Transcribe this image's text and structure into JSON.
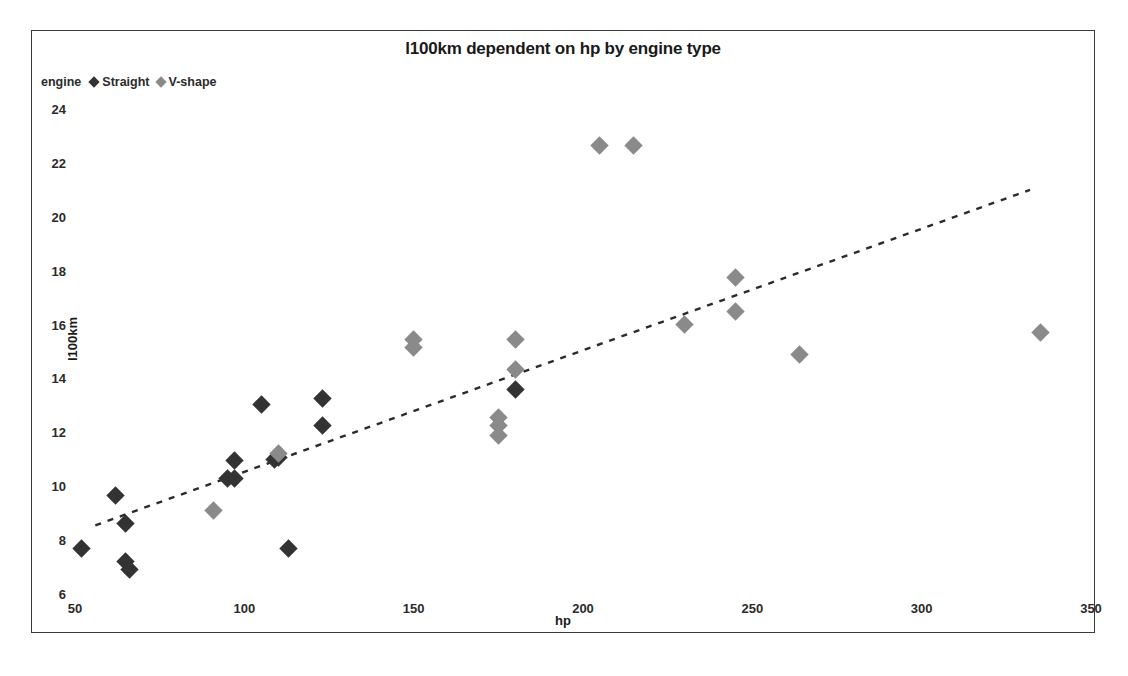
{
  "chart_data": {
    "type": "scatter",
    "title": "l100km dependent on hp by engine type",
    "xlabel": "hp",
    "ylabel": "l100km",
    "xlim": [
      50,
      350
    ],
    "ylim": [
      6,
      24
    ],
    "xticks": [
      50,
      100,
      150,
      200,
      250,
      300,
      350
    ],
    "yticks": [
      6,
      8,
      10,
      12,
      14,
      16,
      18,
      20,
      22,
      24
    ],
    "grid": false,
    "legend": {
      "title": "engine",
      "position": "top-left",
      "entries": [
        {
          "name": "Straight",
          "marker": "diamond",
          "color": "#333333"
        },
        {
          "name": "V-shape",
          "marker": "diamond",
          "color": "#8a8a8a"
        }
      ]
    },
    "series": [
      {
        "name": "Straight",
        "color": "#333333",
        "marker": "diamond",
        "points": [
          {
            "x": 52,
            "y": 7.7
          },
          {
            "x": 62,
            "y": 9.65
          },
          {
            "x": 65,
            "y": 8.6
          },
          {
            "x": 65,
            "y": 7.2
          },
          {
            "x": 66,
            "y": 6.9
          },
          {
            "x": 95,
            "y": 10.3
          },
          {
            "x": 97,
            "y": 10.3
          },
          {
            "x": 97,
            "y": 10.95
          },
          {
            "x": 105,
            "y": 13.05
          },
          {
            "x": 109,
            "y": 11.0
          },
          {
            "x": 110,
            "y": 11.05
          },
          {
            "x": 113,
            "y": 7.7
          },
          {
            "x": 123,
            "y": 13.25
          },
          {
            "x": 123,
            "y": 12.25
          },
          {
            "x": 180,
            "y": 13.6
          }
        ]
      },
      {
        "name": "V-shape",
        "color": "#8a8a8a",
        "marker": "diamond",
        "points": [
          {
            "x": 91,
            "y": 9.1
          },
          {
            "x": 110,
            "y": 11.2
          },
          {
            "x": 150,
            "y": 15.45
          },
          {
            "x": 150,
            "y": 15.15
          },
          {
            "x": 175,
            "y": 12.55
          },
          {
            "x": 175,
            "y": 12.25
          },
          {
            "x": 175,
            "y": 11.9
          },
          {
            "x": 180,
            "y": 15.45
          },
          {
            "x": 180,
            "y": 14.35
          },
          {
            "x": 205,
            "y": 22.65
          },
          {
            "x": 215,
            "y": 22.65
          },
          {
            "x": 230,
            "y": 16.0
          },
          {
            "x": 245,
            "y": 17.75
          },
          {
            "x": 245,
            "y": 16.5
          },
          {
            "x": 264,
            "y": 14.9
          },
          {
            "x": 335,
            "y": 15.7
          }
        ]
      }
    ],
    "trendline": {
      "name": "linear-fit",
      "style": "dashed",
      "color": "#2b2b2b",
      "x0": 56,
      "y0": 8.55,
      "x1": 332,
      "y1": 21.0
    }
  }
}
